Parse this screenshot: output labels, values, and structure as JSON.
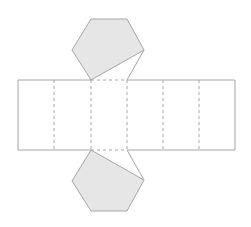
{
  "diagram": {
    "colors": {
      "background": "#ffffff",
      "stroke": "#a6a6a6",
      "face_fill": "#e6e6e6",
      "fold_line": "#a6a6a6"
    },
    "rectangle": {
      "x": 18,
      "y": 80,
      "width": 217,
      "height": 70
    },
    "fold_lines_x": [
      54,
      91,
      127,
      163,
      199
    ],
    "top_fold_segment": {
      "x1": 91,
      "x2": 127,
      "y": 80
    },
    "bottom_fold_segment": {
      "x1": 91,
      "x2": 127,
      "y": 150
    },
    "top_hexagon": {
      "points": "91,19 127,19 144,50 91,80 72,50",
      "tab_line": "144,50 127,80"
    },
    "bottom_hexagon": {
      "points": "91,150 144,180 127,211 91,211 72,181",
      "tab_line": "127,150 144,180"
    }
  }
}
